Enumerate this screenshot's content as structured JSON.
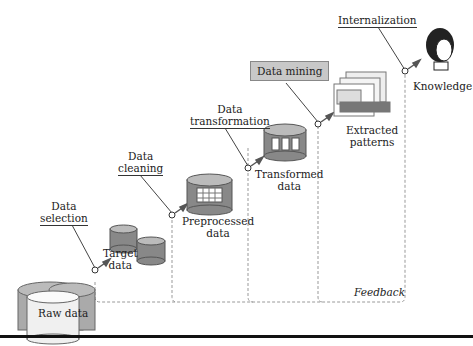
{
  "diagram": {
    "stages": [
      {
        "id": "raw",
        "label": "Raw data"
      },
      {
        "id": "target",
        "label_line1": "Target",
        "label_line2": "data"
      },
      {
        "id": "preprocessed",
        "label_line1": "Preprocessed",
        "label_line2": "data"
      },
      {
        "id": "transformed",
        "label_line1": "Transformed",
        "label_line2": "data"
      },
      {
        "id": "patterns",
        "label_line1": "Extracted",
        "label_line2": "patterns"
      },
      {
        "id": "knowledge",
        "label": "Knowledge"
      }
    ],
    "steps": [
      {
        "line1": "Data",
        "line2": "selection"
      },
      {
        "line1": "Data",
        "line2": "cleaning"
      },
      {
        "line1": "Data",
        "line2": "transformation"
      },
      {
        "label": "Data mining"
      },
      {
        "label": "Internalization"
      }
    ],
    "feedback_label": "Feedback",
    "colors": {
      "cylinder_dark": "#8a8a8a",
      "cylinder_light": "#cfcfcf",
      "arrow": "#555555",
      "dashed": "#999999",
      "box": "#c8c8c8"
    }
  }
}
